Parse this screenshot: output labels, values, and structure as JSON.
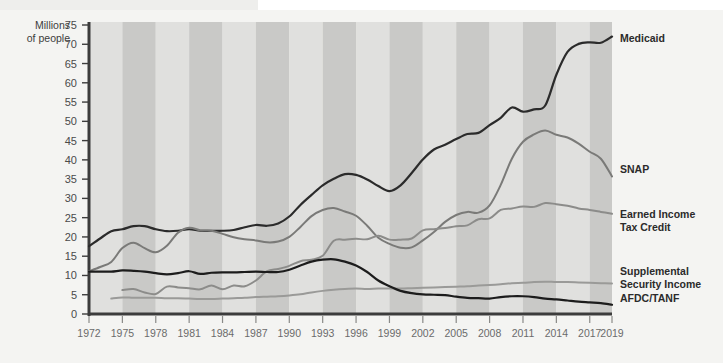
{
  "chart_data": {
    "type": "line",
    "title": "",
    "subtitle": "",
    "xlabel": "",
    "ylabel": "Millions of people",
    "ylabel_line1": "Millions",
    "ylabel_line2": "of people",
    "xlim": [
      1972,
      2019
    ],
    "ylim": [
      0,
      75
    ],
    "yticks": [
      0,
      5,
      10,
      15,
      20,
      25,
      30,
      35,
      40,
      45,
      50,
      55,
      60,
      65,
      70,
      75
    ],
    "xticks": [
      1972,
      1975,
      1978,
      1981,
      1984,
      1987,
      1990,
      1993,
      1996,
      1999,
      2002,
      2005,
      2008,
      2011,
      2014,
      2017,
      2019
    ],
    "grid": false,
    "band_shading": "alternating vertical bands every 3 years",
    "legend_position": "right-of-plot inline labels",
    "colors": {
      "background": "#f4f4f2",
      "band_light": "#e0e0de",
      "band_dark": "#c9c9c7",
      "axis": "#3c3c3c",
      "medicaid": "#2b2b2b",
      "snap": "#7a7a78",
      "eitc": "#8c8c8a",
      "ssi": "#9a9a98",
      "afdc": "#1c1c1c",
      "tick_text": "#6b6b6b",
      "label_text": "#2b2b2b"
    },
    "series": [
      {
        "name": "Medicaid",
        "label": "Medicaid",
        "color": "#2b2b2b",
        "width": 2.2,
        "label_x": 2020.2,
        "label_y": 70.5,
        "x": [
          1972,
          1973,
          1974,
          1975,
          1976,
          1977,
          1978,
          1979,
          1980,
          1981,
          1982,
          1983,
          1984,
          1985,
          1986,
          1987,
          1988,
          1989,
          1990,
          1991,
          1992,
          1993,
          1994,
          1995,
          1996,
          1997,
          1998,
          1999,
          2000,
          2001,
          2002,
          2003,
          2004,
          2005,
          2006,
          2007,
          2008,
          2009,
          2010,
          2011,
          2012,
          2013,
          2014,
          2015,
          2016,
          2017,
          2018,
          2019
        ],
        "values": [
          17.6,
          19.6,
          21.5,
          22.0,
          22.8,
          22.8,
          22.0,
          21.5,
          21.6,
          22.0,
          21.6,
          21.6,
          21.6,
          21.8,
          22.5,
          23.1,
          22.9,
          23.5,
          25.3,
          28.3,
          30.9,
          33.4,
          35.1,
          36.3,
          36.1,
          34.9,
          33.2,
          31.9,
          33.4,
          36.6,
          40.1,
          42.7,
          43.9,
          45.4,
          46.7,
          47.0,
          49.0,
          50.9,
          53.6,
          52.5,
          53.1,
          54.1,
          62.1,
          68.0,
          70.1,
          70.5,
          70.4,
          72.0
        ]
      },
      {
        "name": "SNAP",
        "label": "SNAP",
        "color": "#7a7a78",
        "width": 2.0,
        "label_x": 2020.2,
        "label_y": 36.5,
        "x": [
          1972,
          1973,
          1974,
          1975,
          1976,
          1977,
          1978,
          1979,
          1980,
          1981,
          1982,
          1983,
          1984,
          1985,
          1986,
          1987,
          1988,
          1989,
          1990,
          1991,
          1992,
          1993,
          1994,
          1995,
          1996,
          1997,
          1998,
          1999,
          2000,
          2001,
          2002,
          2003,
          2004,
          2005,
          2006,
          2007,
          2008,
          2009,
          2010,
          2011,
          2012,
          2013,
          2014,
          2015,
          2016,
          2017,
          2018,
          2019
        ],
        "values": [
          11.1,
          12.2,
          13.5,
          17.1,
          18.5,
          17.1,
          16.0,
          17.7,
          21.1,
          22.4,
          21.7,
          21.6,
          20.8,
          19.9,
          19.4,
          19.1,
          18.6,
          18.8,
          20.0,
          22.6,
          25.4,
          27.0,
          27.5,
          26.6,
          25.5,
          22.9,
          19.8,
          18.2,
          17.2,
          17.3,
          19.1,
          21.3,
          23.9,
          25.7,
          26.5,
          26.3,
          28.2,
          33.5,
          40.3,
          44.7,
          46.6,
          47.6,
          46.5,
          45.8,
          44.2,
          42.1,
          40.3,
          35.7
        ]
      },
      {
        "name": "Earned Income Tax Credit",
        "label": "Earned Income Tax Credit",
        "label_line1": "Earned Income",
        "label_line2": "Tax Credit",
        "color": "#8c8c8a",
        "width": 2.0,
        "label_x": 2020.2,
        "label_y": 25.0,
        "x": [
          1975,
          1976,
          1977,
          1978,
          1979,
          1980,
          1981,
          1982,
          1983,
          1984,
          1985,
          1986,
          1987,
          1988,
          1989,
          1990,
          1991,
          1992,
          1993,
          1994,
          1995,
          1996,
          1997,
          1998,
          1999,
          2000,
          2001,
          2002,
          2003,
          2004,
          2005,
          2006,
          2007,
          2008,
          2009,
          2010,
          2011,
          2012,
          2013,
          2014,
          2015,
          2016,
          2017,
          2018,
          2019
        ],
        "values": [
          6.2,
          6.5,
          5.6,
          5.2,
          7.1,
          6.9,
          6.7,
          6.4,
          7.4,
          6.4,
          7.4,
          7.2,
          8.7,
          11.1,
          11.7,
          12.5,
          13.7,
          14.1,
          15.1,
          19.0,
          19.3,
          19.5,
          19.4,
          20.3,
          19.3,
          19.3,
          19.6,
          21.7,
          22.0,
          22.3,
          22.8,
          23.0,
          24.6,
          24.8,
          27.0,
          27.4,
          27.9,
          27.8,
          28.8,
          28.5,
          28.1,
          27.4,
          27.0,
          26.5,
          26.0
        ]
      },
      {
        "name": "Supplemental Security Income",
        "label": "Supplemental Security Income",
        "label_line1": "Supplemental",
        "label_line2": "Security Income",
        "color": "#9a9a98",
        "width": 2.0,
        "label_x": 2020.2,
        "label_y": 10.0,
        "x": [
          1974,
          1975,
          1976,
          1977,
          1978,
          1979,
          1980,
          1981,
          1982,
          1983,
          1984,
          1985,
          1986,
          1987,
          1988,
          1989,
          1990,
          1991,
          1992,
          1993,
          1994,
          1995,
          1996,
          1997,
          1998,
          1999,
          2000,
          2001,
          2002,
          2003,
          2004,
          2005,
          2006,
          2007,
          2008,
          2009,
          2010,
          2011,
          2012,
          2013,
          2014,
          2015,
          2016,
          2017,
          2018,
          2019
        ],
        "values": [
          4.0,
          4.3,
          4.2,
          4.2,
          4.2,
          4.1,
          4.1,
          4.0,
          3.9,
          3.9,
          4.0,
          4.1,
          4.2,
          4.4,
          4.5,
          4.6,
          4.8,
          5.1,
          5.6,
          6.0,
          6.3,
          6.5,
          6.6,
          6.5,
          6.6,
          6.6,
          6.6,
          6.7,
          6.8,
          6.9,
          7.0,
          7.1,
          7.2,
          7.4,
          7.5,
          7.7,
          8.0,
          8.1,
          8.3,
          8.4,
          8.3,
          8.3,
          8.2,
          8.1,
          8.0,
          7.9
        ]
      },
      {
        "name": "AFDC/TANF",
        "label": "AFDC/TANF",
        "color": "#1c1c1c",
        "width": 2.2,
        "label_x": 2020.2,
        "label_y": 3.2,
        "x": [
          1972,
          1973,
          1974,
          1975,
          1976,
          1977,
          1978,
          1979,
          1980,
          1981,
          1982,
          1983,
          1984,
          1985,
          1986,
          1987,
          1988,
          1989,
          1990,
          1991,
          1992,
          1993,
          1994,
          1995,
          1996,
          1997,
          1998,
          1999,
          2000,
          2001,
          2002,
          2003,
          2004,
          2005,
          2006,
          2007,
          2008,
          2009,
          2010,
          2011,
          2012,
          2013,
          2014,
          2015,
          2016,
          2017,
          2018,
          2019
        ],
        "values": [
          11.0,
          11.0,
          11.0,
          11.3,
          11.2,
          11.0,
          10.6,
          10.3,
          10.6,
          11.1,
          10.4,
          10.7,
          10.8,
          10.8,
          10.9,
          11.0,
          10.9,
          10.9,
          11.5,
          12.6,
          13.6,
          14.1,
          14.2,
          13.6,
          12.6,
          10.9,
          8.7,
          7.2,
          6.0,
          5.4,
          5.1,
          5.0,
          4.9,
          4.5,
          4.2,
          4.1,
          4.0,
          4.4,
          4.6,
          4.6,
          4.4,
          4.0,
          3.8,
          3.5,
          3.2,
          3.0,
          2.8,
          2.4
        ]
      }
    ]
  },
  "axis": {
    "y_title_line1": "Millions",
    "y_title_line2": "of people"
  }
}
